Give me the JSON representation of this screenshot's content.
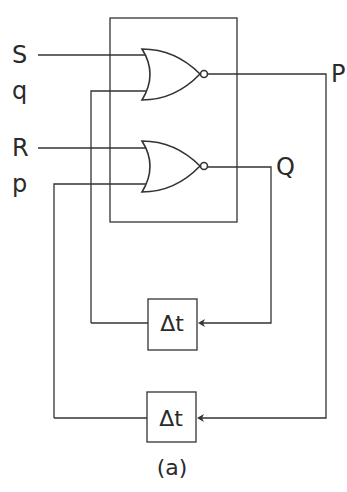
{
  "diagram": {
    "type": "nor-latch-with-delay-feedback",
    "inputs": {
      "S": "S",
      "q": "q",
      "R": "R",
      "p": "p"
    },
    "outputs": {
      "P": "P",
      "Q": "Q"
    },
    "gates": [
      {
        "id": "nor-top",
        "type": "NOR",
        "inputs": [
          "S",
          "q"
        ],
        "output": "P"
      },
      {
        "id": "nor-bottom",
        "type": "NOR",
        "inputs": [
          "R",
          "p"
        ],
        "output": "Q"
      }
    ],
    "delays": [
      {
        "id": "delay-top",
        "label": "Δt",
        "from": "Q",
        "to": "q"
      },
      {
        "id": "delay-bottom",
        "label": "Δt",
        "from": "P",
        "to": "p"
      }
    ],
    "caption": "(a)"
  }
}
